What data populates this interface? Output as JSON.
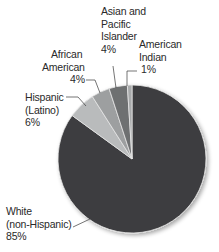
{
  "chart_data": {
    "type": "pie",
    "title": "",
    "categories": [
      "White (non-Hispanic)",
      "Hispanic (Latino)",
      "African American",
      "Asian and Pacific Islander",
      "American Indian"
    ],
    "values": [
      85,
      6,
      4,
      4,
      1
    ],
    "unit": "%",
    "colors": [
      "#3d3d3f",
      "#b9bbbc",
      "#9d9fa0",
      "#6e6f71",
      "#a8aaab"
    ],
    "start_angle_deg": 0,
    "direction": "clockwise",
    "legend": "none (direct labels with leader lines)"
  },
  "labels": {
    "white": {
      "line1": "White",
      "line2": "(non-Hispanic)",
      "value": "85%"
    },
    "hispanic": {
      "line1": "Hispanic",
      "line2": "(Latino)",
      "value": "6%"
    },
    "african": {
      "line1": "African",
      "line2": "American",
      "value": "4%"
    },
    "asian": {
      "line1": "Asian and",
      "line2": "Pacific",
      "line3": "Islander",
      "value": "4%"
    },
    "indian": {
      "line1": "American",
      "line2": "Indian",
      "value": "1%"
    }
  }
}
